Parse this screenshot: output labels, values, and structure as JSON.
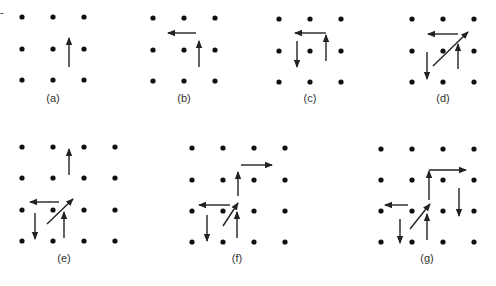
{
  "figure": {
    "panels": [
      {
        "id": "a",
        "label": "(a)",
        "grid": {
          "cols": 3,
          "rows": 3,
          "xs": [
            22,
            53,
            84
          ],
          "ys": [
            17,
            49,
            80
          ]
        },
        "label_pos": [
          53,
          102
        ],
        "arrows": [
          {
            "dir": "up",
            "from": [
              69,
              67
            ],
            "to": [
              69,
              38
            ]
          }
        ]
      },
      {
        "id": "b",
        "label": "(b)",
        "grid": {
          "cols": 3,
          "rows": 3,
          "xs": [
            153,
            184,
            215
          ],
          "ys": [
            18,
            50,
            81
          ]
        },
        "label_pos": [
          184,
          102
        ],
        "arrows": [
          {
            "dir": "left",
            "from": [
              196,
              33
            ],
            "to": [
              168,
              33
            ]
          },
          {
            "dir": "up",
            "from": [
              199,
              67
            ],
            "to": [
              199,
              41
            ]
          }
        ]
      },
      {
        "id": "c",
        "label": "(c)",
        "grid": {
          "cols": 3,
          "rows": 3,
          "xs": [
            279,
            310,
            341
          ],
          "ys": [
            19,
            51,
            82
          ]
        },
        "label_pos": [
          310,
          102
        ],
        "arrows": [
          {
            "dir": "up",
            "from": [
              326,
              61
            ],
            "to": [
              326,
              35
            ]
          },
          {
            "dir": "left",
            "from": [
              326,
              33
            ],
            "to": [
              295,
              33
            ]
          },
          {
            "dir": "down",
            "from": [
              297,
              41
            ],
            "to": [
              297,
              67
            ]
          }
        ]
      },
      {
        "id": "d",
        "label": "(d)",
        "grid": {
          "cols": 3,
          "rows": 3,
          "xs": [
            412,
            443,
            474
          ],
          "ys": [
            19,
            51,
            82
          ]
        },
        "label_pos": [
          443,
          102
        ],
        "arrows": [
          {
            "dir": "left",
            "from": [
              458,
              34
            ],
            "to": [
              428,
              34
            ]
          },
          {
            "dir": "up-right",
            "from": [
              433,
              66
            ],
            "to": [
              468,
              32
            ]
          },
          {
            "dir": "up",
            "from": [
              458,
              69
            ],
            "to": [
              458,
              44
            ]
          },
          {
            "dir": "down",
            "from": [
              427,
              52
            ],
            "to": [
              427,
              79
            ]
          }
        ]
      },
      {
        "id": "e",
        "label": "(e)",
        "grid": {
          "cols": 4,
          "rows": 4,
          "xs": [
            22,
            53,
            84,
            115
          ],
          "ys": [
            147,
            178,
            210,
            241
          ]
        },
        "label_pos": [
          64,
          262
        ],
        "arrows": [
          {
            "dir": "up",
            "from": [
              69,
              175
            ],
            "to": [
              69,
              149
            ]
          },
          {
            "dir": "left",
            "from": [
              59,
              202
            ],
            "to": [
              30,
              202
            ]
          },
          {
            "dir": "up-right",
            "from": [
              47,
              224
            ],
            "to": [
              73,
              199
            ]
          },
          {
            "dir": "up",
            "from": [
              64,
              238
            ],
            "to": [
              64,
              212
            ]
          },
          {
            "dir": "down",
            "from": [
              35,
              213
            ],
            "to": [
              35,
              239
            ]
          }
        ]
      },
      {
        "id": "f",
        "label": "(f)",
        "grid": {
          "cols": 4,
          "rows": 4,
          "xs": [
            192,
            223,
            254,
            285
          ],
          "ys": [
            148,
            180,
            211,
            242
          ]
        },
        "label_pos": [
          237,
          262
        ],
        "arrows": [
          {
            "dir": "right",
            "from": [
              241,
              165
            ],
            "to": [
              272,
              165
            ]
          },
          {
            "dir": "up",
            "from": [
              238,
              196
            ],
            "to": [
              238,
              172
            ]
          },
          {
            "dir": "left",
            "from": [
              230,
              205
            ],
            "to": [
              199,
              205
            ]
          },
          {
            "dir": "up-right",
            "from": [
              223,
              226
            ],
            "to": [
              238,
              203
            ]
          },
          {
            "dir": "up",
            "from": [
              237,
              238
            ],
            "to": [
              237,
              212
            ]
          },
          {
            "dir": "down",
            "from": [
              207,
              215
            ],
            "to": [
              207,
              241
            ]
          }
        ]
      },
      {
        "id": "g",
        "label": "(g)",
        "grid": {
          "cols": 4,
          "rows": 4,
          "xs": [
            381,
            412,
            443,
            474
          ],
          "ys": [
            149,
            180,
            211,
            242
          ]
        },
        "label_pos": [
          427,
          262
        ],
        "arrows": [
          {
            "dir": "right",
            "from": [
              429,
              170
            ],
            "to": [
              466,
              170
            ]
          },
          {
            "dir": "up",
            "from": [
              429,
              200
            ],
            "to": [
              429,
              171
            ]
          },
          {
            "dir": "down",
            "from": [
              459,
              188
            ],
            "to": [
              459,
              216
            ]
          },
          {
            "dir": "left",
            "from": [
              408,
              205
            ],
            "to": [
              385,
              205
            ]
          },
          {
            "dir": "up-right",
            "from": [
              410,
              229
            ],
            "to": [
              430,
              204
            ]
          },
          {
            "dir": "up",
            "from": [
              427,
              240
            ],
            "to": [
              427,
              214
            ]
          },
          {
            "dir": "down",
            "from": [
              400,
              219
            ],
            "to": [
              400,
              243
            ]
          }
        ]
      }
    ]
  }
}
